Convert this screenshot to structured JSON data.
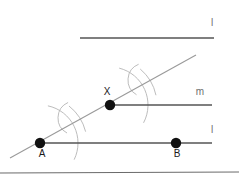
{
  "figure": {
    "canvas": {
      "width": 239,
      "height": 185,
      "background": "#ffffff"
    }
  },
  "labels": {
    "line_top": "l",
    "line_m": "m",
    "line_l": "l",
    "point_a": "A",
    "point_b": "B",
    "point_x": "X"
  },
  "colors": {
    "line_solid": "#555555",
    "line_light": "#9a9a9a",
    "arc": "#b4b4b4",
    "point_fill": "#111111",
    "label_dark": "#1a1a1a",
    "label_faint": "#6e6e6e",
    "border": "#444444"
  },
  "chart_data": {
    "type": "diagram",
    "xlabel": "",
    "ylabel": "",
    "xlim": [
      0,
      239
    ],
    "ylim": [
      0,
      185
    ],
    "grid": false,
    "legend": "none",
    "points": [
      {
        "name": "A",
        "x": 40,
        "y": 143,
        "label": "A",
        "label_dx": 2,
        "label_dy": 14,
        "radius": 5.2
      },
      {
        "name": "B",
        "x": 176,
        "y": 143,
        "label": "B",
        "label_dx": 1,
        "label_dy": 14,
        "radius": 5.2
      },
      {
        "name": "X",
        "x": 110,
        "y": 105,
        "label": "X",
        "label_dx": -3,
        "label_dy": -10,
        "radius": 5.2
      }
    ],
    "segments": [
      {
        "name": "line-top",
        "x1": 80,
        "y1": 38,
        "x2": 214,
        "y2": 38,
        "label": "l",
        "label_x": 212,
        "label_y": 26,
        "stroke": "#555555",
        "width": 1.6
      },
      {
        "name": "line-m",
        "x1": 110,
        "y1": 105,
        "x2": 212,
        "y2": 105,
        "label": "m",
        "label_x": 200,
        "label_y": 95,
        "stroke": "#555555",
        "width": 1.6
      },
      {
        "name": "line-l",
        "x1": 40,
        "y1": 143,
        "x2": 212,
        "y2": 143,
        "label": "l",
        "label_x": 212,
        "label_y": 133,
        "stroke": "#555555",
        "width": 1.6
      },
      {
        "name": "transversal",
        "x1": 10,
        "y1": 158,
        "x2": 196,
        "y2": 55,
        "label": "",
        "label_x": 0,
        "label_y": 0,
        "stroke": "#9a9a9a",
        "width": 1.1
      },
      {
        "name": "bottom-border",
        "x1": 0,
        "y1": 173,
        "x2": 239,
        "y2": 172,
        "label": "",
        "label_x": 0,
        "label_y": 0,
        "stroke": "#444444",
        "width": 0.8
      }
    ],
    "arcs": [
      {
        "name": "arc-at-a-large",
        "cx": 40,
        "cy": 143,
        "r": 38,
        "start_deg": -78,
        "end_deg": 26,
        "stroke": "#b4b4b4"
      },
      {
        "name": "arc-at-a-cross-1",
        "cx": 40,
        "cy": 143,
        "r": 47,
        "start_deg": -52,
        "end_deg": -14,
        "stroke": "#b4b4b4"
      },
      {
        "name": "arc-at-a-cross-2",
        "cx": 75,
        "cy": 118,
        "r": 17,
        "start_deg": 118,
        "end_deg": 246,
        "stroke": "#b4b4b4"
      },
      {
        "name": "arc-at-x-large",
        "cx": 110,
        "cy": 105,
        "r": 38,
        "start_deg": -76,
        "end_deg": 28,
        "stroke": "#b4b4b4"
      },
      {
        "name": "arc-at-x-cross-1",
        "cx": 110,
        "cy": 105,
        "r": 47,
        "start_deg": -50,
        "end_deg": -12,
        "stroke": "#b4b4b4"
      },
      {
        "name": "arc-at-x-cross-2",
        "cx": 145,
        "cy": 80,
        "r": 17,
        "start_deg": 120,
        "end_deg": 248,
        "stroke": "#b4b4b4"
      }
    ]
  }
}
